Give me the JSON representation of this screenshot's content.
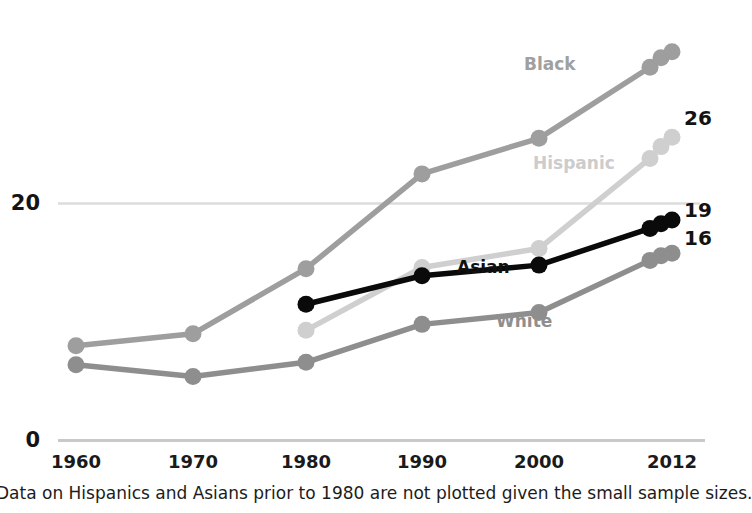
{
  "chart_data": {
    "type": "line",
    "title": "",
    "subtitle": "",
    "xlabel": "",
    "ylabel": "",
    "x": [
      1960,
      1970,
      1980,
      1990,
      2000,
      2010,
      2011,
      2012
    ],
    "xtick_labels": [
      "1960",
      "1970",
      "1980",
      "1990",
      "2000",
      "2012"
    ],
    "xtick_values": [
      1960,
      1970,
      1980,
      1990,
      2000,
      2012
    ],
    "ytick_labels": [
      "0",
      "20"
    ],
    "ytick_values": [
      0,
      20
    ],
    "ylim": [
      0,
      34
    ],
    "xlim": [
      1956,
      1015
    ],
    "grid": "horizontal-single-at-20",
    "legend": "inline-series-labels",
    "markers": "circle",
    "series": [
      {
        "name": "Black",
        "label": "Black",
        "color": "#9e9e9e",
        "label_color": "#a0a0a0",
        "end_value": null,
        "end_label": "",
        "x": [
          1960,
          1970,
          1980,
          1990,
          2000,
          2010,
          2011,
          2012
        ],
        "values": [
          8.0,
          9.0,
          14.5,
          22.5,
          25.5,
          31.5,
          32.3,
          32.8
        ]
      },
      {
        "name": "Hispanic",
        "label": "Hispanic",
        "color": "#cfcfcf",
        "label_color": "#cccccc",
        "end_value": 26,
        "end_label": "26",
        "x": [
          1980,
          1990,
          2000,
          2010,
          2011,
          2012
        ],
        "values": [
          9.3,
          14.6,
          16.2,
          23.8,
          24.8,
          25.6
        ]
      },
      {
        "name": "Asian",
        "label": "Asian",
        "color": "#0a0a0a",
        "label_color": "#101010",
        "end_value": 19,
        "end_label": "19",
        "x": [
          1980,
          1990,
          2000,
          2010,
          2011,
          2012
        ],
        "values": [
          11.5,
          13.9,
          14.8,
          17.9,
          18.3,
          18.6
        ]
      },
      {
        "name": "White",
        "label": "White",
        "color": "#8e8e8e",
        "label_color": "#8f8f8f",
        "end_value": 16,
        "end_label": "16",
        "x": [
          1960,
          1970,
          1980,
          1990,
          2000,
          2010,
          2011,
          2012
        ],
        "values": [
          6.4,
          5.4,
          6.6,
          9.8,
          10.8,
          15.2,
          15.6,
          15.8
        ]
      }
    ],
    "annotations": [
      "Data on Hispanics and Asians prior to 1980 are not plotted given the small sample sizes."
    ]
  },
  "footnote": {
    "text": "Data on Hispanics and Asians prior to 1980 are not plotted given the small sample sizes."
  },
  "axis": {
    "y_ticks": [
      {
        "label": "20"
      },
      {
        "label": "0"
      }
    ],
    "x_ticks": [
      {
        "label": "1960"
      },
      {
        "label": "1970"
      },
      {
        "label": "1980"
      },
      {
        "label": "1990"
      },
      {
        "label": "2000"
      },
      {
        "label": "2012"
      }
    ]
  },
  "series_labels": {
    "black": "Black",
    "hispanic": "Hispanic",
    "asian": "Asian",
    "white": "White"
  },
  "end_labels": {
    "hispanic": "26",
    "asian": "19",
    "white": "16"
  },
  "colors": {
    "black_series": "#9e9e9e",
    "hispanic_series": "#cfcfcf",
    "asian_series": "#0a0a0a",
    "white_series": "#8e8e8e",
    "gridline": "#d8d8d8",
    "axisline": "#c9c9c9",
    "text": "#1a1a1a"
  }
}
